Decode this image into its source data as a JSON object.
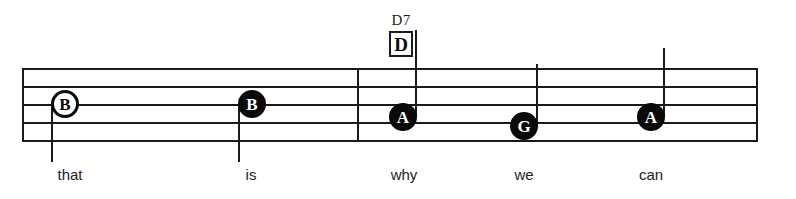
{
  "staff": {
    "line_count": 5,
    "left_x": 22,
    "right_x": 757,
    "top_y": 68,
    "bottom_y": 140,
    "line_spacing": 18,
    "color": "#1a1a1a"
  },
  "barlines": [
    {
      "name": "barline-start",
      "x": 22
    },
    {
      "name": "barline-measure-2",
      "x": 357
    },
    {
      "name": "barline-end",
      "x": 757
    }
  ],
  "chord": {
    "name": "D7",
    "box_label": "D",
    "x": 403,
    "y": 14
  },
  "notes": [
    {
      "id": "note-1",
      "pitch": "B",
      "head": "hollow",
      "x": 65,
      "y": 104,
      "stem_direction": "down",
      "stem_x": 51,
      "stem_top": 104,
      "stem_bottom": 162,
      "lyric": "that"
    },
    {
      "id": "note-2",
      "pitch": "B",
      "head": "filled",
      "x": 252,
      "y": 104,
      "stem_direction": "down",
      "stem_x": 238,
      "stem_top": 104,
      "stem_bottom": 162,
      "lyric": "is"
    },
    {
      "id": "note-3",
      "pitch": "A",
      "head": "filled",
      "x": 403,
      "y": 117,
      "stem_direction": "up",
      "stem_x": 416,
      "stem_top": 30,
      "stem_bottom": 117,
      "lyric": "why"
    },
    {
      "id": "note-4",
      "pitch": "G",
      "head": "filled",
      "x": 524,
      "y": 126,
      "stem_direction": "up",
      "stem_x": 537,
      "stem_top": 64,
      "stem_bottom": 126,
      "lyric": "we"
    },
    {
      "id": "note-5",
      "pitch": "A",
      "head": "filled",
      "x": 651,
      "y": 117,
      "stem_direction": "up",
      "stem_x": 664,
      "stem_top": 48,
      "stem_bottom": 117,
      "lyric": "can"
    }
  ],
  "lyrics": [
    {
      "text": "that",
      "x": 70
    },
    {
      "text": "is",
      "x": 251
    },
    {
      "text": "why",
      "x": 404
    },
    {
      "text": "we",
      "x": 524
    },
    {
      "text": "can",
      "x": 651
    }
  ],
  "colors": {
    "background": "#ffffff",
    "ink": "#1a1a1a",
    "note_fill": "#0a0a0a",
    "note_text_light": "#ffffff"
  }
}
